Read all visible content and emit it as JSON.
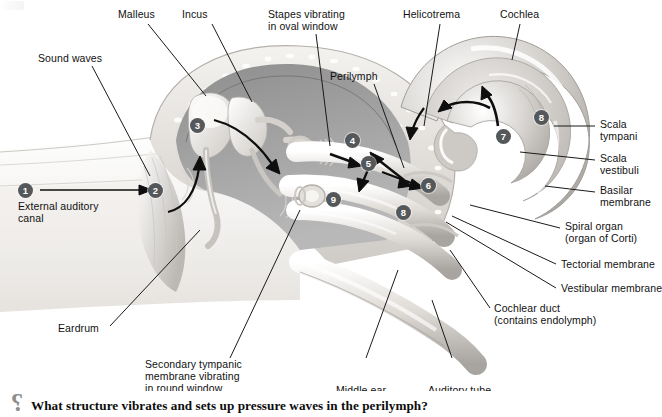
{
  "figure": {
    "style": "grayscale anatomical illustration",
    "background_color": "#ffffff",
    "badge_color": "#55585a",
    "badge_text_color": "#ffffff",
    "leader_line_color": "#1a1a1a"
  },
  "labels": [
    {
      "id": "malleus",
      "text": "Malleus"
    },
    {
      "id": "incus",
      "text": "Incus"
    },
    {
      "id": "stapes",
      "text": "Stapes vibrating\nin oval window"
    },
    {
      "id": "helicotrema",
      "text": "Helicotrema"
    },
    {
      "id": "cochlea",
      "text": "Cochlea"
    },
    {
      "id": "sound-waves",
      "text": "Sound waves"
    },
    {
      "id": "perilymph",
      "text": "Perilymph"
    },
    {
      "id": "scala-tympani",
      "text": "Scala\ntympani"
    },
    {
      "id": "scala-vestibuli",
      "text": "Scala\nvestibuli"
    },
    {
      "id": "basilar-membrane",
      "text": "Basilar\nmembrane"
    },
    {
      "id": "spiral-organ",
      "text": "Spiral organ\n(organ of Corti)"
    },
    {
      "id": "tectorial-membrane",
      "text": "Tectorial membrane"
    },
    {
      "id": "vestibular-membrane",
      "text": "Vestibular membrane"
    },
    {
      "id": "cochlear-duct",
      "text": "Cochlear duct\n(contains endolymph)"
    },
    {
      "id": "external-auditory-canal",
      "text": "External auditory\ncanal"
    },
    {
      "id": "eardrum",
      "text": "Eardrum"
    },
    {
      "id": "secondary-tympanic",
      "text": "Secondary tympanic\nmembrane vibrating\nin round window"
    },
    {
      "id": "middle-ear",
      "text": "Middle ear"
    },
    {
      "id": "auditory-tube",
      "text": "Auditory tube"
    }
  ],
  "badges": [
    {
      "n": "1"
    },
    {
      "n": "2"
    },
    {
      "n": "3"
    },
    {
      "n": "4"
    },
    {
      "n": "5"
    },
    {
      "n": "6"
    },
    {
      "n": "7"
    },
    {
      "n": "8"
    },
    {
      "n": "9"
    },
    {
      "n": "8"
    }
  ],
  "question": {
    "icon": "question-mark-icon",
    "glyph": "?",
    "text": "What structure vibrates and sets up pressure waves in the perilymph?"
  }
}
